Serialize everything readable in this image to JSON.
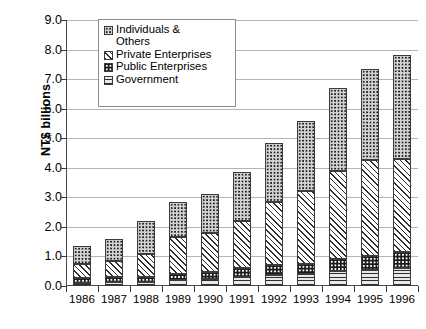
{
  "chart_data": {
    "type": "bar",
    "subtype": "stacked-bar",
    "title": "",
    "xlabel": "",
    "ylabel": "NT$ billions",
    "ylim": [
      0.0,
      9.0
    ],
    "ytick_step": 1.0,
    "ytick_labels": [
      "9.0",
      "8.0",
      "7.0",
      "6.0",
      "5.0",
      "4.0",
      "3.0",
      "2.0",
      "1.0",
      "0.0"
    ],
    "ytick_values": [
      9.0,
      8.0,
      7.0,
      6.0,
      5.0,
      4.0,
      3.0,
      2.0,
      1.0,
      0.0
    ],
    "grid": true,
    "grid_axis": "y",
    "legend_position": "top-left-inside",
    "categories": [
      "1986",
      "1987",
      "1988",
      "1989",
      "1990",
      "1991",
      "1992",
      "1993",
      "1994",
      "1995",
      "1996"
    ],
    "series": [
      {
        "name": "Government",
        "key": "government",
        "pattern": "horizontal-lines",
        "values": [
          0.1,
          0.12,
          0.14,
          0.22,
          0.25,
          0.32,
          0.38,
          0.42,
          0.5,
          0.55,
          0.6
        ]
      },
      {
        "name": "Public Enterprises",
        "key": "public",
        "pattern": "dark-speckle",
        "values": [
          0.18,
          0.18,
          0.18,
          0.2,
          0.22,
          0.3,
          0.34,
          0.33,
          0.42,
          0.46,
          0.55
        ]
      },
      {
        "name": "Private Enterprises",
        "key": "private",
        "pattern": "diagonal-hatch",
        "values": [
          0.47,
          0.55,
          0.78,
          1.23,
          1.33,
          1.58,
          2.13,
          2.45,
          2.98,
          3.24,
          3.15
        ]
      },
      {
        "name": "Individuals & Others",
        "key": "individuals",
        "pattern": "light-dots",
        "values": [
          0.6,
          0.75,
          1.1,
          1.2,
          1.3,
          1.65,
          2.0,
          2.4,
          2.8,
          3.1,
          3.5
        ]
      }
    ],
    "totals": [
      1.35,
      1.6,
      2.2,
      2.85,
      3.1,
      3.85,
      4.85,
      5.6,
      6.7,
      7.35,
      7.8
    ]
  },
  "legend": {
    "items": [
      {
        "label": "Individuals &\nOthers",
        "key": "individuals"
      },
      {
        "label": "Private Enterprises",
        "key": "private"
      },
      {
        "label": "Public Enterprises",
        "key": "public"
      },
      {
        "label": "Government",
        "key": "government"
      }
    ]
  },
  "colors": {
    "axis": "#3a3a3a",
    "gridline": "#b4b4b4",
    "legend_border": "#8c8c8c",
    "segment_outline": "#3b3b3b",
    "government_fill": "#e9e9e9",
    "public_fill": "#1a1a1a",
    "private_fill": "#ffffff",
    "individuals_fill": "#d2d2d2",
    "background": "#ffffff"
  }
}
